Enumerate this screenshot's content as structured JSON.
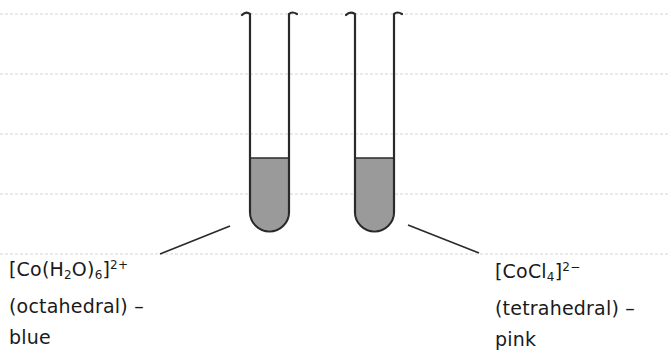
{
  "diagram": {
    "ruled_lines_y": [
      14,
      74,
      134,
      194,
      254
    ],
    "colors": {
      "ruled_line": "#d4d4d4",
      "outline": "#2a2a2a",
      "liquid": "#9a9a9a",
      "background": "#ffffff"
    },
    "tubes": [
      {
        "id": "left",
        "complex": {
          "prefix": "[Co(H",
          "sub1": "2",
          "mid": "O)",
          "sub2": "6",
          "suffix": "]",
          "charge": "2+"
        },
        "geometry": "(octahedral) –",
        "colour": "blue"
      },
      {
        "id": "right",
        "complex": {
          "prefix": "[CoCl",
          "sub1": "4",
          "suffix": "]",
          "charge": "2−"
        },
        "geometry": "(tetrahedral) –",
        "colour": "pink"
      }
    ]
  }
}
